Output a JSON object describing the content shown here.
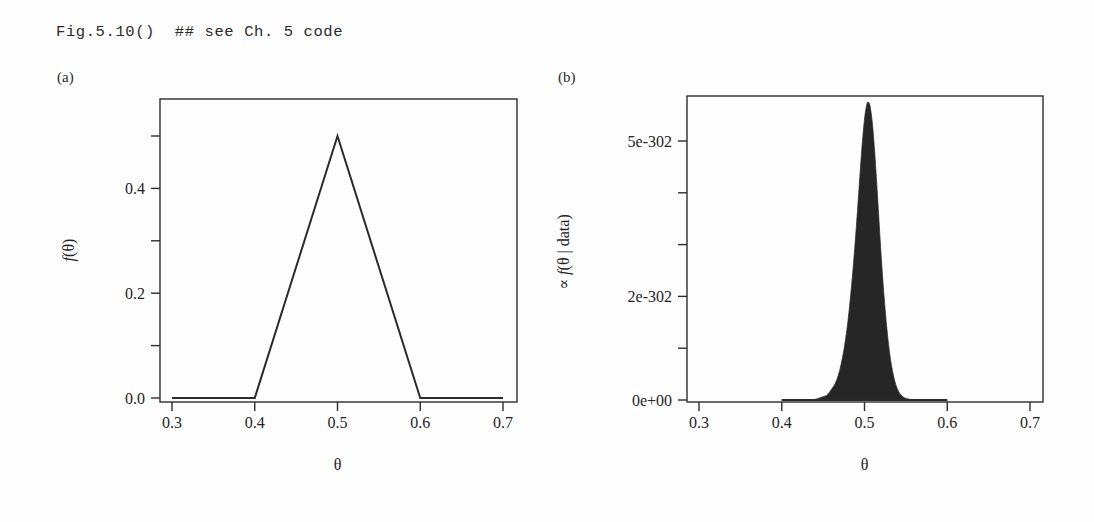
{
  "header": {
    "code_text": "Fig.5.10()  ## see Ch. 5 code"
  },
  "panels": [
    {
      "id": "a",
      "label": "(a)",
      "ylabel": "f(θ)",
      "xlabel": "θ"
    },
    {
      "id": "b",
      "label": "(b)",
      "ylabel": "∝ f(θ | data)",
      "xlabel": "θ"
    }
  ],
  "chart_data": [
    {
      "type": "line",
      "panel": "(a)",
      "title": "",
      "xlabel": "θ",
      "ylabel": "f(θ)",
      "xlim": [
        0.28,
        0.715
      ],
      "ylim": [
        -0.018,
        0.545
      ],
      "xticks": [
        0.3,
        0.4,
        0.5,
        0.6,
        0.7
      ],
      "xticklabels": [
        "0.3",
        "0.4",
        "0.5",
        "0.6",
        "0.7"
      ],
      "yticks": [
        0.0,
        0.1,
        0.2,
        0.3,
        0.4,
        0.5
      ],
      "yticklabels": [
        "0.0",
        "",
        "0.2",
        "",
        "0.4",
        ""
      ],
      "grid": false,
      "legend": false,
      "description": "Triangular prior density on theta, zero outside [0.4,0.6], peak 0.5 at theta=0.5",
      "x": [
        0.3,
        0.4,
        0.5,
        0.6,
        0.7
      ],
      "y": [
        0.0,
        0.0,
        0.5,
        0.0,
        0.0
      ]
    },
    {
      "type": "area",
      "panel": "(b)",
      "title": "",
      "xlabel": "θ",
      "ylabel": "∝ f(θ | data)",
      "xlim": [
        0.28,
        0.715
      ],
      "ylim": [
        -2e-303,
        5.9e-302
      ],
      "xticks": [
        0.3,
        0.4,
        0.5,
        0.6,
        0.7
      ],
      "xticklabels": [
        "0.3",
        "0.4",
        "0.5",
        "0.6",
        "0.7"
      ],
      "yticks": [
        0.0,
        1e-302,
        2e-302,
        3e-302,
        4e-302,
        5e-302
      ],
      "yticklabels": [
        "0e+00",
        "",
        "2e-302",
        "",
        "",
        "5e-302"
      ],
      "grid": false,
      "legend": false,
      "description": "Unnormalized posterior of theta, sharply peaked near 0.51, support [0.4,0.6]",
      "x": [
        0.4,
        0.42,
        0.44,
        0.455,
        0.465,
        0.47,
        0.475,
        0.48,
        0.485,
        0.49,
        0.493,
        0.496,
        0.499,
        0.502,
        0.505,
        0.508,
        0.511,
        0.514,
        0.517,
        0.52,
        0.524,
        0.528,
        0.532,
        0.537,
        0.542,
        0.548,
        0.556,
        0.565,
        0.58,
        0.6
      ],
      "y": [
        0.0,
        0.0,
        1e-304,
        9e-304,
        3.2e-303,
        5.6e-303,
        9.4e-303,
        1.5e-302,
        2.3e-302,
        3.3e-302,
        4e-302,
        4.7e-302,
        5.3e-302,
        5.7e-302,
        5.8e-302,
        5.6e-302,
        5.1e-302,
        4.4e-302,
        3.6e-302,
        2.8e-302,
        1.9e-302,
        1.2e-302,
        7e-303,
        3.2e-303,
        1.3e-303,
        4e-304,
        8e-305,
        1e-305,
        0.0,
        0.0
      ]
    }
  ]
}
